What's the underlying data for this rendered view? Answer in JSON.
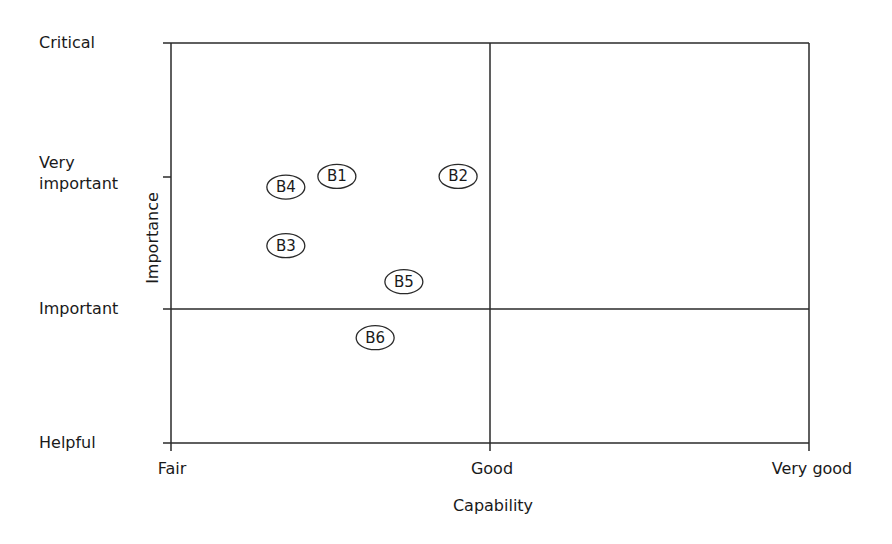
{
  "chart_data": {
    "type": "scatter",
    "title": "",
    "xlabel": "Capability",
    "ylabel": "Importance",
    "x_ticks": [
      "Fair",
      "Good",
      "Very good"
    ],
    "y_ticks": [
      "Helpful",
      "Important",
      "Very important",
      "Critical"
    ],
    "xlim": [
      0,
      2
    ],
    "ylim": [
      0,
      3
    ],
    "grid": false,
    "quadrant_dividers": {
      "x": 1,
      "y": 1
    },
    "legend": null,
    "points": [
      {
        "label": "B1",
        "x": 0.52,
        "y": 2.0
      },
      {
        "label": "B2",
        "x": 0.9,
        "y": 2.0
      },
      {
        "label": "B3",
        "x": 0.36,
        "y": 1.48
      },
      {
        "label": "B4",
        "x": 0.36,
        "y": 1.92
      },
      {
        "label": "B5",
        "x": 0.73,
        "y": 1.21
      },
      {
        "label": "B6",
        "x": 0.64,
        "y": 0.79
      }
    ]
  },
  "labels": {
    "y_critical": "Critical",
    "y_very": "Very",
    "y_important_2": "important",
    "y_important": "Important",
    "y_helpful": "Helpful",
    "x_fair": "Fair",
    "x_good": "Good",
    "x_very_good": "Very good",
    "x_axis": "Capability",
    "y_axis": "Importance"
  }
}
